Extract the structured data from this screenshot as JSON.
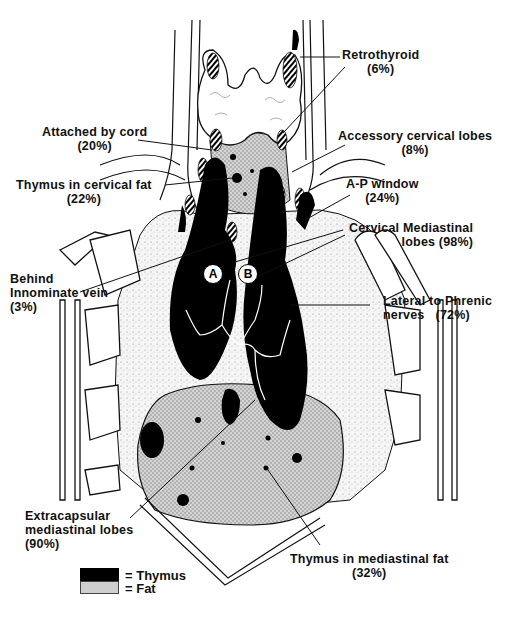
{
  "diagram": {
    "labels": {
      "retrothyroid": {
        "name": "Retrothyroid",
        "pct": "(6%)"
      },
      "attached_by_cord": {
        "name": "Attached by cord",
        "pct": "(20%)"
      },
      "accessory_cervical_lobes": {
        "name": "Accessory cervical lobes",
        "pct": "(8%)"
      },
      "thymus_in_cervical_fat": {
        "name": "Thymus in cervical fat",
        "pct": "(22%)"
      },
      "ap_window": {
        "name": "A-P window",
        "pct": "(24%)"
      },
      "cervical_mediastinal_lobes": {
        "name_line1": "Cervical Mediastinal",
        "name_line2": "lobes (98%)"
      },
      "behind_innominate_vein": {
        "line1": "Behind",
        "line2": "Innominate vein",
        "pct": "(3%)"
      },
      "lateral_to_phrenic": {
        "line1": "Lateral to Phrenic",
        "line2": "nerves",
        "pct": "(72%)"
      },
      "extracapsular_mediastinal_lobes": {
        "line1": "Extracapsular",
        "line2": "mediastinal lobes",
        "pct": "(90%)"
      },
      "thymus_in_mediastinal_fat": {
        "name": "Thymus in mediastinal fat",
        "pct": "(32%)"
      }
    },
    "markers": {
      "a": "A",
      "b": "B"
    },
    "legend": {
      "thymus": "= Thymus",
      "fat": "= Fat"
    },
    "colors": {
      "thymus": "#000000",
      "fat": "#c8c8c8",
      "thyroid": "#ffffff",
      "line": "#111111"
    }
  }
}
